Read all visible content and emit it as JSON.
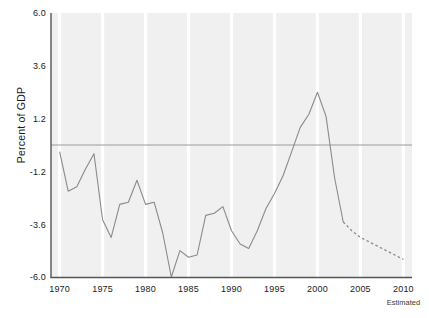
{
  "axis_title_y": "Percent of GDP",
  "footnote": "Estimated",
  "chart_data": {
    "type": "line",
    "title": "",
    "subtitle": "",
    "xlabel": "",
    "ylabel": "Percent of GDP",
    "xlim": [
      1969,
      2011
    ],
    "ylim": [
      -6.0,
      6.0
    ],
    "yticks": [
      6.0,
      3.6,
      1.2,
      -1.2,
      -3.6,
      -6.0
    ],
    "ytick_labels": [
      "6.0",
      "3.6",
      "1.2",
      "-1.2",
      "-3.6",
      "-6.0"
    ],
    "xticks": [
      1970,
      1975,
      1980,
      1985,
      1990,
      1995,
      2000,
      2005,
      2010
    ],
    "xtick_labels": [
      "1970",
      "1975",
      "1980",
      "1985",
      "1990",
      "1995",
      "2000",
      "2005",
      "2010"
    ],
    "grid": "vertical-white-bands",
    "legend": "none",
    "zero_reference_line": 0,
    "annotations": [
      {
        "text": "Estimated",
        "x": 2010,
        "position": "below-axis"
      }
    ],
    "series": [
      {
        "name": "Actual",
        "style": "solid",
        "color": "#8a8a8a",
        "x": [
          1970,
          1971,
          1972,
          1973,
          1974,
          1975,
          1976,
          1977,
          1978,
          1979,
          1980,
          1981,
          1982,
          1983,
          1984,
          1985,
          1986,
          1987,
          1988,
          1989,
          1990,
          1991,
          1992,
          1993,
          1994,
          1995,
          1996,
          1997,
          1998,
          1999,
          2000,
          2001,
          2002,
          2003
        ],
        "values": [
          -0.3,
          -2.1,
          -1.9,
          -1.1,
          -0.4,
          -3.4,
          -4.2,
          -2.7,
          -2.6,
          -1.6,
          -2.7,
          -2.6,
          -4.0,
          -6.0,
          -4.8,
          -5.1,
          -5.0,
          -3.2,
          -3.1,
          -2.8,
          -3.9,
          -4.5,
          -4.7,
          -3.9,
          -2.9,
          -2.2,
          -1.4,
          -0.3,
          0.8,
          1.4,
          2.4,
          1.3,
          -1.5,
          -3.5
        ]
      },
      {
        "name": "Estimated",
        "style": "dashed",
        "color": "#8a8a8a",
        "x": [
          2003,
          2004,
          2005,
          2006,
          2007,
          2008,
          2009,
          2010
        ],
        "values": [
          -3.5,
          -3.9,
          -4.2,
          -4.4,
          -4.6,
          -4.8,
          -5.0,
          -5.2
        ]
      }
    ]
  },
  "style": {
    "plot_background": "#f0f0f0",
    "gridline_color": "#ffffff",
    "axis_color": "#555555",
    "line_color": "#8a8a8a",
    "zero_line_color": "#9a9a9a",
    "text_color": "#1b1b1b"
  }
}
